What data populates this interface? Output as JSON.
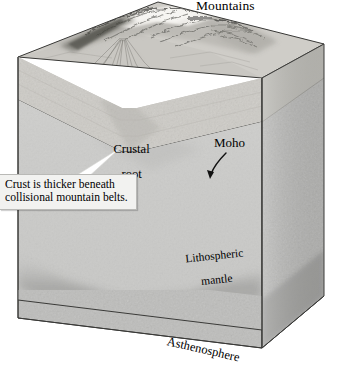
{
  "figure": {
    "type": "geologic-block-diagram",
    "palette": {
      "background": "#ffffff",
      "outline": "#2b2b2b",
      "crust_front": "#cdcbc6",
      "crust_side": "#b3b1ac",
      "mantle_front": "#cbcbc9",
      "mantle_side": "#b0b0ae",
      "asthenosphere_front": "#b6b6b4",
      "asthenosphere_side": "#9e9e9c",
      "terrain_light": "#e6e4e0",
      "terrain_dark": "#4a4a47",
      "callout_fill": "#f2f2f0",
      "callout_border": "#b9b9b6",
      "leader": "#ffffff",
      "text": "#000000"
    }
  },
  "labels": {
    "mountains": "Mountains",
    "crustal_root_line1": "Crustal",
    "crustal_root_line2": "root",
    "moho": "Moho",
    "lithospheric_mantle_line1": "Lithospheric",
    "lithospheric_mantle_line2": "mantle",
    "asthenosphere": "Asthenosphere"
  },
  "callout": {
    "text": "Crust is thicker beneath\ncollisional mountain belts."
  },
  "annotations": {
    "moho_arrow": "curved-arrow-pointing-down-left-to-crust-mantle-boundary",
    "callout_leader": "white-tapered-leader-to-crustal-root"
  }
}
